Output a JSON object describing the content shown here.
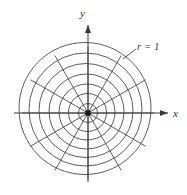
{
  "figure": {
    "background_color": "#ffffff",
    "stroke_color": "#3a3a3a",
    "width": 187,
    "height": 195,
    "origin": {
      "x": 88,
      "y": 113
    },
    "origin_marker": "filled-square"
  },
  "labels": {
    "x_axis": "x",
    "y_axis": "y",
    "curve": "r = 1"
  },
  "chart_data": {
    "type": "line",
    "subtype": "polar-grid",
    "title": "",
    "xlabel": "x",
    "ylabel": "y",
    "grid": true,
    "legend": "none",
    "annotations": [
      {
        "text": "r = 1",
        "target": "outermost-circle",
        "x": 137,
        "y": 42
      }
    ],
    "coordinate_system": "polar",
    "origin_px": [
      88,
      113
    ],
    "axes": {
      "x": {
        "from_px": [
          14,
          113
        ],
        "to_px": [
          170,
          113
        ],
        "arrow": "end"
      },
      "y": {
        "from_px": [
          88,
          182
        ],
        "to_px": [
          88,
          22
        ],
        "arrow": "end"
      }
    },
    "circles": {
      "count": 7,
      "radii_r": [
        0.143,
        0.286,
        0.429,
        0.571,
        0.714,
        0.857,
        1.0
      ],
      "radii_px": [
        9.5,
        19,
        28,
        37.5,
        47,
        56.5,
        66
      ],
      "outermost_r": 1,
      "center_offsets_px": [
        [
          0,
          0
        ],
        [
          -0.5,
          -0.5
        ],
        [
          -1,
          -1
        ],
        [
          -1.5,
          -1.5
        ],
        [
          -2,
          -2.5
        ],
        [
          -2.5,
          -3.5
        ],
        [
          -3,
          -4.5
        ]
      ]
    },
    "rays": {
      "count": 12,
      "angle_step_deg": 30,
      "angles_deg": [
        0,
        30,
        60,
        90,
        120,
        150,
        180,
        210,
        240,
        270,
        300,
        330
      ],
      "length_px": 66
    }
  }
}
